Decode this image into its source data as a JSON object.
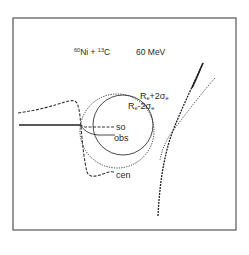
{
  "figure": {
    "title": {
      "reaction_mass1": "60",
      "reaction_elem1": "Ni",
      "reaction_op": " + ",
      "reaction_mass2": "13",
      "reaction_elem2": "C",
      "energy": "60 MeV"
    },
    "circle_labels": {
      "outer": {
        "main": "R",
        "sub": "e",
        "op": "+2σ",
        "sub2": "e"
      },
      "inner": {
        "main": "R",
        "sub": "e",
        "op": "-2σ",
        "sub2": "e"
      }
    },
    "curve_labels": {
      "so": "so",
      "obs": "obs",
      "cen": "cen"
    },
    "colors": {
      "ink": "#2a2a2a",
      "frame": "#555555",
      "background": "#ffffff"
    }
  }
}
